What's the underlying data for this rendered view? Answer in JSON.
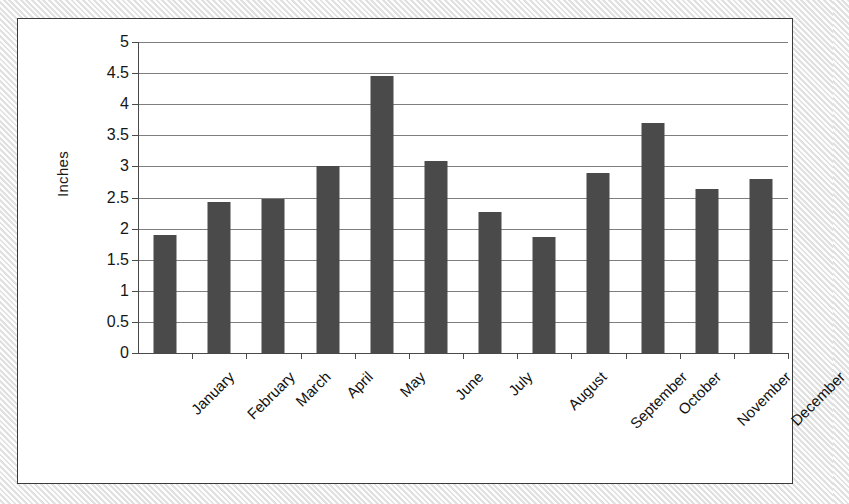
{
  "chart_data": {
    "type": "bar",
    "title": "",
    "xlabel": "",
    "ylabel": "Inches",
    "ylim": [
      0,
      5
    ],
    "ytick_step": 0.5,
    "grid": true,
    "legend": "none",
    "bar_color": "#4a4a4a",
    "categories": [
      "January",
      "February",
      "March",
      "April",
      "May",
      "June",
      "July",
      "August",
      "September",
      "October",
      "November",
      "December"
    ],
    "values": [
      1.9,
      2.43,
      2.48,
      3.01,
      4.46,
      3.09,
      2.26,
      1.87,
      2.9,
      3.69,
      2.64,
      2.8
    ],
    "ytick_labels": [
      "0",
      "0.5",
      "1",
      "1.5",
      "2",
      "2.5",
      "3",
      "3.5",
      "4",
      "4.5",
      "5"
    ],
    "ytick_values": [
      0,
      0.5,
      1,
      1.5,
      2,
      2.5,
      3,
      3.5,
      4,
      4.5,
      5
    ]
  },
  "colors": {
    "bar": "#4a4a4a",
    "gridline": "#7e7e7e",
    "axis": "#4a4a4a",
    "frame_border": "#3b3b3b",
    "plot_background": "#ffffff",
    "page_background": "#f2f2f2",
    "text": "#161616"
  }
}
